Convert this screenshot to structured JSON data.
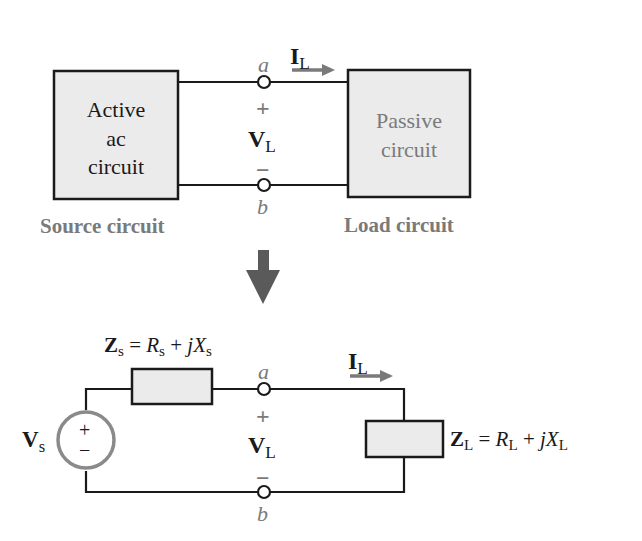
{
  "top": {
    "source_box": {
      "lines": [
        "Active",
        "ac",
        "circuit"
      ]
    },
    "load_box": {
      "lines": [
        "Passive",
        "circuit"
      ]
    },
    "source_caption": "Source circuit",
    "load_caption": "Load circuit",
    "terminal_a": "a",
    "terminal_b": "b",
    "plus": "+",
    "minus": "−",
    "voltage": {
      "main": "V",
      "sub": "L"
    },
    "current": {
      "main": "I",
      "sub": "L"
    }
  },
  "arrow": {
    "direction": "down",
    "color": "#5a5a5a"
  },
  "bottom": {
    "source_voltage": {
      "main": "V",
      "sub": "s"
    },
    "source_plus": "+",
    "source_minus": "−",
    "zs_label": {
      "main": "Z",
      "sub": "s",
      "eq": " = ",
      "r": "R",
      "r_sub": "s",
      "plus": " + ",
      "jx": "jX",
      "jx_sub": "s"
    },
    "zl_label": {
      "main": "Z",
      "sub": "L",
      "eq": " = ",
      "r": "R",
      "r_sub": "L",
      "plus": " + ",
      "jx": "jX",
      "jx_sub": "L"
    },
    "terminal_a": "a",
    "terminal_b": "b",
    "plus": "+",
    "minus": "−",
    "voltage": {
      "main": "V",
      "sub": "L"
    },
    "current": {
      "main": "I",
      "sub": "L"
    }
  },
  "colors": {
    "wire": "#1a1a1a",
    "box_fill": "#ebebeb",
    "accent_gray": "#7a7a7a",
    "source_circle": "#8a8a8a"
  }
}
